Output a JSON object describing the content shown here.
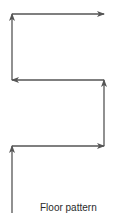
{
  "diagram": {
    "caption": "Floor pattern",
    "stroke_color": "#555555",
    "path_direction": "serpentine upward: up, right, up, left, up, right",
    "segments": [
      {
        "name": "segment-1-up",
        "direction": "up"
      },
      {
        "name": "segment-2-right",
        "direction": "right"
      },
      {
        "name": "segment-3-up",
        "direction": "up"
      },
      {
        "name": "segment-4-left",
        "direction": "left"
      },
      {
        "name": "segment-5-up",
        "direction": "up"
      },
      {
        "name": "segment-6-right",
        "direction": "right"
      }
    ]
  }
}
